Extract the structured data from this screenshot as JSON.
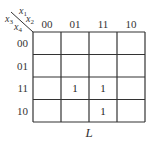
{
  "kmap": {
    "row_var": "x3x4",
    "col_var": "x1x2",
    "row_var_parts": [
      {
        "base": "x",
        "sub": "3"
      },
      {
        "base": "x",
        "sub": "4"
      }
    ],
    "col_var_parts": [
      {
        "base": "x",
        "sub": "1"
      },
      {
        "base": "x",
        "sub": "2"
      }
    ],
    "col_labels": [
      "00",
      "01",
      "11",
      "10"
    ],
    "row_labels": [
      "00",
      "01",
      "11",
      "10"
    ],
    "cells": [
      [
        "",
        "",
        "",
        ""
      ],
      [
        "",
        "",
        "",
        ""
      ],
      [
        "",
        "1",
        "1",
        ""
      ],
      [
        "",
        "",
        "1",
        ""
      ]
    ],
    "function_name": "L"
  }
}
